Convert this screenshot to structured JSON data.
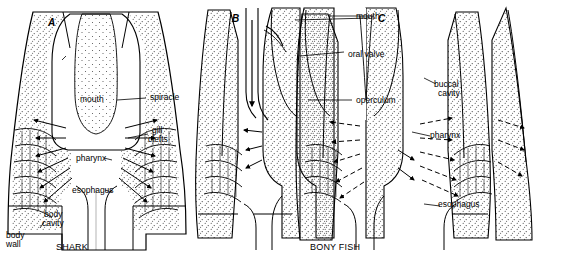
{
  "figure": {
    "title": "",
    "panels": [
      {
        "id": "A",
        "letter": "A",
        "caption": "SHARK"
      },
      {
        "id": "B",
        "letter": "B",
        "caption": "BONY FISH"
      },
      {
        "id": "C",
        "letter": "C",
        "caption": ""
      }
    ],
    "labels": {
      "mouth_a": "mouth",
      "spiracle": "spiracle",
      "gill_clefts": "gill\nclefts",
      "gill_clefts_line1": "gill",
      "gill_clefts_line2": "clefts",
      "pharynx_a": "pharynx",
      "esophagus_a": "esophagus",
      "body_cavity_line1": "body",
      "body_cavity_line2": "cavity",
      "body_wall_line1": "body",
      "body_wall_line2": "wall",
      "mouth_c": "mouth",
      "oral_valve": "oral valve",
      "operculum": "operculum",
      "buccal_cavity_line1": "buccal",
      "buccal_cavity_line2": "cavity",
      "pharynx_c": "pharynx",
      "esophagus_c": "esophagus"
    },
    "colors": {
      "ink": "#000000",
      "background": "#ffffff",
      "stipple": "#444444"
    }
  }
}
